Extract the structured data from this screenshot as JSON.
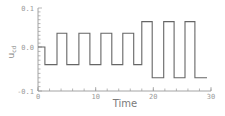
{
  "chart_data": {
    "type": "line",
    "title": "",
    "xlabel": "Time",
    "ylabel": "u_cd",
    "xlim": [
      0,
      30
    ],
    "ylim": [
      -0.1,
      0.1
    ],
    "grid": false,
    "legend": null,
    "x_ticks": [
      0,
      10,
      20,
      30
    ],
    "x_tick_labels": [
      "0",
      "10",
      "20",
      "30"
    ],
    "y_ticks": [
      0.1,
      0.0,
      -0.1
    ],
    "y_tick_labels": [
      "0.1",
      "0.0",
      "-0.1"
    ],
    "step": true,
    "series": [
      {
        "name": "u_cd",
        "color": "#666666",
        "points": [
          [
            0.0,
            0.0
          ],
          [
            1.2,
            0.0
          ],
          [
            1.2,
            -0.04
          ],
          [
            3.3,
            -0.04
          ],
          [
            3.3,
            0.035
          ],
          [
            5.0,
            0.035
          ],
          [
            5.0,
            -0.04
          ],
          [
            7.1,
            -0.04
          ],
          [
            7.1,
            0.035
          ],
          [
            9.0,
            0.035
          ],
          [
            9.0,
            -0.04
          ],
          [
            10.9,
            -0.04
          ],
          [
            10.9,
            0.035
          ],
          [
            12.8,
            0.035
          ],
          [
            12.8,
            -0.04
          ],
          [
            14.7,
            -0.04
          ],
          [
            14.7,
            0.035
          ],
          [
            16.6,
            0.035
          ],
          [
            16.6,
            -0.04
          ],
          [
            18.0,
            -0.04
          ],
          [
            18.0,
            0.065
          ],
          [
            19.8,
            0.065
          ],
          [
            19.8,
            -0.07
          ],
          [
            21.8,
            -0.07
          ],
          [
            21.8,
            0.065
          ],
          [
            23.6,
            0.065
          ],
          [
            23.6,
            -0.07
          ],
          [
            25.5,
            -0.07
          ],
          [
            25.5,
            0.065
          ],
          [
            27.2,
            0.065
          ],
          [
            27.2,
            -0.07
          ],
          [
            29.3,
            -0.07
          ]
        ]
      }
    ]
  }
}
